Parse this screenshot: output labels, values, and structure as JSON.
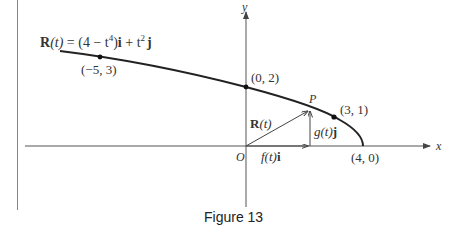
{
  "figure": {
    "caption": "Figure 13",
    "equation": {
      "prefix_bold": "R",
      "arg": "(t)",
      "eq": " = (4 − t",
      "pow4": "4",
      "mid": ")",
      "i": "i",
      "plus": " + t",
      "pow2": "2",
      "j": "j"
    },
    "axes": {
      "x_label": "x",
      "y_label": "y",
      "origin_label": "O"
    },
    "points": [
      {
        "label": "(−5, 3)",
        "x": -5,
        "y": 3
      },
      {
        "label": "(0, 2)",
        "x": 0,
        "y": 2
      },
      {
        "label": "(3, 1)",
        "x": 3,
        "y": 1
      },
      {
        "label": "(4, 0)",
        "x": 4,
        "y": 0
      }
    ],
    "point_P_label": "P",
    "vector_labels": {
      "position": "R",
      "position_arg": "(t)",
      "horizontal": "f(t)",
      "horizontal_unit": "i",
      "vertical": "g(t)",
      "vertical_unit": "j"
    },
    "colors": {
      "curve": "#222222",
      "axis": "#555555",
      "text": "#333333"
    }
  }
}
